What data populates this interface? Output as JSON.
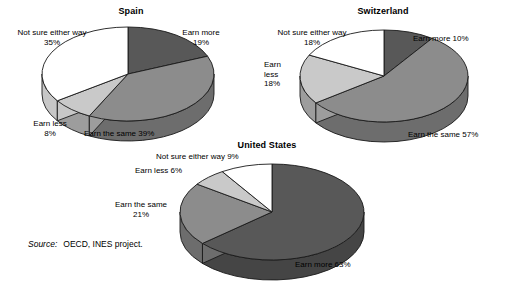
{
  "source": {
    "label": "Source:",
    "text": "OECD, INES project."
  },
  "chart_data": [
    {
      "type": "pie",
      "title": "Spain",
      "categories": [
        "Earn more",
        "Earn the same",
        "Earn less",
        "Not sure either way"
      ],
      "values": [
        19,
        39,
        8,
        35
      ],
      "labels": [
        {
          "name": "Earn more",
          "line1": "Earn more",
          "line2": "19%",
          "value": 19,
          "text": "Earn more 19%"
        },
        {
          "name": "Earn the same",
          "line1": "Earn the same 39%",
          "line2": "",
          "value": 39,
          "text": "Earn the same 39%"
        },
        {
          "name": "Earn less",
          "line1": "Earn less",
          "line2": "8%",
          "value": 8,
          "text": "Earn less 8%"
        },
        {
          "name": "Not sure either way",
          "line1": "Not sure either way",
          "line2": "35%",
          "value": 35,
          "text": "Not sure either way 35%"
        }
      ],
      "colors": [
        "#585858",
        "#8c8c8c",
        "#c9c9c9",
        "#ffffff"
      ],
      "legend": "none",
      "grid": false
    },
    {
      "type": "pie",
      "title": "Switzerland",
      "categories": [
        "Earn more",
        "Earn the same",
        "Earn less",
        "Not sure either way"
      ],
      "values": [
        10,
        57,
        18,
        18
      ],
      "labels": [
        {
          "name": "Earn more",
          "line1": "Earn more 10%",
          "line2": "",
          "value": 10,
          "text": "Earn more 10%"
        },
        {
          "name": "Earn the same",
          "line1": "Earn the same 57%",
          "line2": "",
          "value": 57,
          "text": "Earn the same 57%"
        },
        {
          "name": "Earn less",
          "line1": "Earn",
          "line2": "less",
          "line3": "18%",
          "value": 18,
          "text": "Earn less 18%"
        },
        {
          "name": "Not sure either way",
          "line1": "Not sure either way",
          "line2": "18%",
          "value": 18,
          "text": "Not sure either way 18%"
        }
      ],
      "colors": [
        "#585858",
        "#8c8c8c",
        "#c9c9c9",
        "#ffffff"
      ],
      "legend": "none",
      "grid": false
    },
    {
      "type": "pie",
      "title": "United States",
      "categories": [
        "Earn more",
        "Earn the same",
        "Earn less",
        "Not sure either way"
      ],
      "values": [
        63,
        21,
        6,
        9
      ],
      "labels": [
        {
          "name": "Earn more",
          "line1": "Earn more 63%",
          "line2": "",
          "value": 63,
          "text": "Earn more 63%"
        },
        {
          "name": "Earn the same",
          "line1": "Earn the same",
          "line2": "21%",
          "value": 21,
          "text": "Earn the same 21%"
        },
        {
          "name": "Earn less",
          "line1": "Earn less 6%",
          "line2": "",
          "value": 6,
          "text": "Earn less 6%"
        },
        {
          "name": "Not sure either way",
          "line1": "Not sure either way 9%",
          "line2": "",
          "value": 9,
          "text": "Not sure either way 9%"
        }
      ],
      "colors": [
        "#585858",
        "#8c8c8c",
        "#c9c9c9",
        "#ffffff"
      ],
      "legend": "none",
      "grid": false
    }
  ]
}
